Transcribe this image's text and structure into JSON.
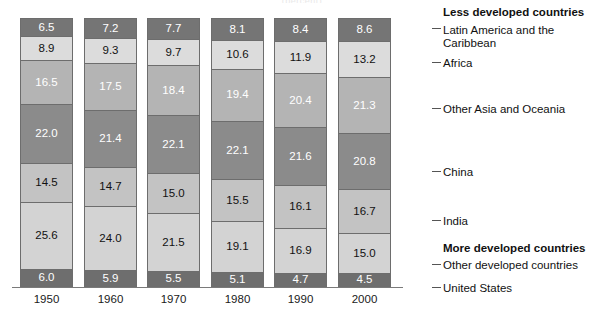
{
  "title_remnant": "(percent)",
  "chart_data": {
    "type": "bar",
    "title": "",
    "subtitle": "",
    "xlabel": "",
    "ylabel": "",
    "ylim": [
      0,
      100
    ],
    "grid": false,
    "stacked": true,
    "stack_order": "top-to-bottom",
    "legend_position": "right",
    "categories": [
      "1950",
      "1960",
      "1970",
      "1980",
      "1990",
      "2000"
    ],
    "series": [
      {
        "name": "Latin America and the Caribbean",
        "group": "Less developed countries",
        "color": "#757575",
        "text_color": "#ffffff",
        "values": [
          6.5,
          7.2,
          7.7,
          8.1,
          8.4,
          8.6
        ]
      },
      {
        "name": "Africa",
        "group": "Less developed countries",
        "color": "#dcdcdc",
        "text_color": "#111111",
        "values": [
          8.9,
          9.3,
          9.7,
          10.6,
          11.9,
          13.2
        ]
      },
      {
        "name": "Other Asia and Oceania",
        "group": "Less developed countries",
        "color": "#b4b4b4",
        "text_color": "#ffffff",
        "values": [
          16.5,
          17.5,
          18.4,
          19.4,
          20.4,
          21.3
        ]
      },
      {
        "name": "China",
        "group": "Less developed countries",
        "color": "#8b8b8b",
        "text_color": "#ffffff",
        "values": [
          22.0,
          21.4,
          22.1,
          22.1,
          21.6,
          20.8
        ]
      },
      {
        "name": "India",
        "group": "Less developed countries",
        "color": "#c3c3c3",
        "text_color": "#111111",
        "values": [
          14.5,
          14.7,
          15.0,
          15.5,
          16.1,
          16.7
        ]
      },
      {
        "name": "Other developed countries",
        "group": "More developed countries",
        "color": "#d3d3d3",
        "text_color": "#111111",
        "values": [
          25.6,
          24.0,
          21.5,
          19.1,
          16.9,
          15.0
        ]
      },
      {
        "name": "United States",
        "group": "More developed countries",
        "color": "#6e6e6e",
        "text_color": "#ffffff",
        "values": [
          6.0,
          5.9,
          5.5,
          5.1,
          4.7,
          4.5
        ]
      }
    ],
    "group_headers": [
      "Less developed countries",
      "More developed countries"
    ],
    "legend_labels": [
      "Latin America and the",
      "Caribbean",
      "Africa",
      "Other Asia and Oceania",
      "China",
      "India",
      "Other developed countries",
      "United States"
    ]
  },
  "bars": [
    {
      "year": "1950",
      "values": [
        "6.5",
        "8.9",
        "16.5",
        "22.0",
        "14.5",
        "25.6",
        "6.0"
      ]
    },
    {
      "year": "1960",
      "values": [
        "7.2",
        "9.3",
        "17.5",
        "21.4",
        "14.7",
        "24.0",
        "5.9"
      ]
    },
    {
      "year": "1970",
      "values": [
        "7.7",
        "9.7",
        "18.4",
        "22.1",
        "15.0",
        "21.5",
        "5.5"
      ]
    },
    {
      "year": "1980",
      "values": [
        "8.1",
        "10.6",
        "19.4",
        "22.1",
        "15.5",
        "19.1",
        "5.1"
      ]
    },
    {
      "year": "1990",
      "values": [
        "8.4",
        "11.9",
        "20.4",
        "21.6",
        "16.1",
        "16.9",
        "4.7"
      ]
    },
    {
      "year": "2000",
      "values": [
        "8.6",
        "13.2",
        "21.3",
        "20.8",
        "16.7",
        "15.0",
        "4.5"
      ]
    }
  ],
  "legend": {
    "header_less": "Less developed countries",
    "header_more": "More developed countries",
    "latin_america_line1": "Latin America and the",
    "latin_america_line2": "Caribbean",
    "africa": "Africa",
    "other_asia": "Other Asia and Oceania",
    "china": "China",
    "india": "India",
    "other_developed": "Other developed countries",
    "united_states": "United States"
  }
}
